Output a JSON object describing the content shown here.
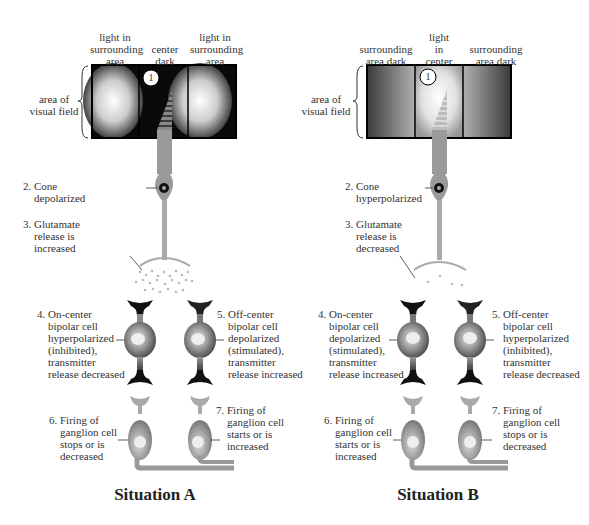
{
  "situations": [
    {
      "title": "Situation A",
      "field_labels": [
        "light in\nsurrounding\narea",
        "center\ndark",
        "light in\nsurrounding\narea"
      ],
      "area_label": "area of\nvisual field",
      "marker": "1",
      "step2": "2. Cone\n    depolarized",
      "step3": "3. Glutamate\n    release is\n    increased",
      "step4": "4. On-center\n    bipolar cell\n    hyperpolarized\n    (inhibited),\n    transmitter\n    release decreased",
      "step5": "5. Off-center\n    bipolar cell\n    depolarized\n    (stimulated),\n    transmitter\n    release increased",
      "step6": "6. Firing of\n    ganglion cell\n    stops or is\n    decreased",
      "step7": "7. Firing of\n    ganglion cell\n    starts or is\n    increased"
    },
    {
      "title": "Situation B",
      "field_labels": [
        "surrounding\narea dark",
        "light\nin\ncenter",
        "surrounding\narea dark"
      ],
      "area_label": "area of\nvisual field",
      "marker": "1",
      "step2": "2. Cone\n    hyperpolarized",
      "step3": "3. Glutamate\n    release is\n    decreased",
      "step4": "4. On-center\n    bipolar cell\n    depolarized\n    (stimulated),\n    transmitter\n    release increased",
      "step5": "5. Off-center\n    bipolar cell\n    hyperpolarized\n    (inhibited),\n    transmitter\n    release decreased",
      "step6": "6. Firing of\n    ganglion cell\n    starts or is\n    increased",
      "step7": "7. Firing of\n    ganglion cell\n    stops or is\n    decreased"
    }
  ],
  "colors": {
    "cell_gray": "#9a9a9a",
    "dark": "#1a1a1a",
    "text": "#333333"
  }
}
